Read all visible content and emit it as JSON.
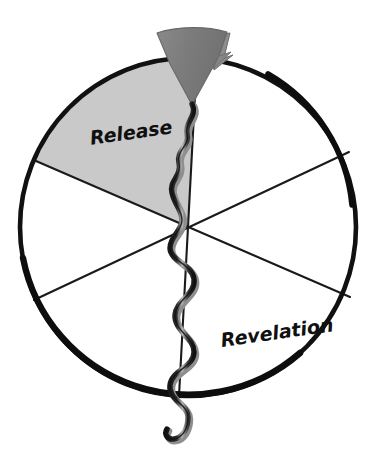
{
  "figure": {
    "title": "",
    "type": "wheel-diagram",
    "background_color": "#ffffff",
    "width": 382,
    "height": 469
  },
  "wheel": {
    "name": "six-segment-wheel",
    "center_x": 188,
    "center_y": 227,
    "radius_x": 170,
    "radius_y": 171,
    "stroke_color": "#111111",
    "fill_color": "#ffffff",
    "segment_line_color": "#1a1a1a",
    "segment_count": 6,
    "divider_angles_deg": [
      22,
      82,
      142,
      202,
      262,
      322
    ]
  },
  "segments": [
    {
      "id": "segment-release",
      "label": "Release",
      "label_x": 132,
      "label_y": 133,
      "label_rotation_deg": -8,
      "label_font_size": 19,
      "fill_color": "#c9c9c9",
      "highlighted": true,
      "start_angle_deg": 240,
      "end_angle_deg": 293
    },
    {
      "id": "segment-revelation",
      "label": "Revelation",
      "label_x": 278,
      "label_y": 333,
      "label_rotation_deg": -8,
      "label_font_size": 19,
      "fill_color": "#ffffff",
      "highlighted": false,
      "start_angle_deg": 22,
      "end_angle_deg": 82
    },
    {
      "id": "segment-unlabeled-1",
      "label": "",
      "fill_color": "#ffffff",
      "highlighted": false
    },
    {
      "id": "segment-unlabeled-2",
      "label": "",
      "fill_color": "#ffffff",
      "highlighted": false
    },
    {
      "id": "segment-unlabeled-3",
      "label": "",
      "fill_color": "#ffffff",
      "highlighted": false
    },
    {
      "id": "segment-unlabeled-4",
      "label": "",
      "fill_color": "#ffffff",
      "highlighted": false
    }
  ],
  "funnel": {
    "name": "funnel-triangle",
    "fill_color": "#7d7d7d",
    "stroke_color": "#6a6a6a",
    "tip_x": 192,
    "tip_y": 104,
    "top_left_x": 158,
    "top_right_x": 226,
    "top_y": 30
  },
  "serpent": {
    "name": "serpent-squiggle",
    "stroke_color": "#0f0f0f",
    "highlight_color": "#9a9a9a",
    "stroke_width": 5,
    "start_x": 192,
    "start_y": 104,
    "end_x": 181,
    "end_y": 441,
    "wave_count": 9
  },
  "colors": {
    "ink": "#111111",
    "highlight_gray": "#c9c9c9",
    "funnel_gray": "#7d7d7d",
    "white": "#ffffff"
  }
}
